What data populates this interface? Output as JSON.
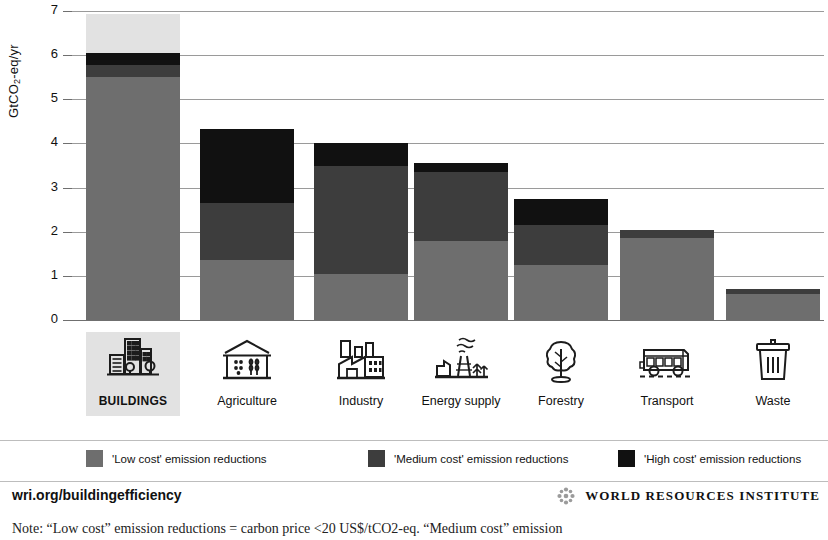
{
  "chart_data": {
    "type": "bar",
    "stacked": true,
    "title": "",
    "xlabel": "",
    "ylabel": "GtCO2-eq/yr",
    "ylim": [
      0,
      7
    ],
    "yticks": [
      0,
      1,
      2,
      3,
      4,
      5,
      6,
      7
    ],
    "ytick_labels": [
      "0",
      "1",
      "2",
      "3",
      "4",
      "5",
      "6",
      "7"
    ],
    "grid": true,
    "legend_position": "bottom",
    "categories": [
      "BUILDINGS",
      "Agriculture",
      "Industry",
      "Energy supply",
      "Forestry",
      "Transport",
      "Waste"
    ],
    "series": [
      {
        "name": "'Low cost' emission reductions",
        "color": "#6e6e6e",
        "values": [
          5.5,
          1.35,
          1.05,
          1.8,
          1.25,
          1.85,
          0.6
        ]
      },
      {
        "name": "'Medium cost' emission reductions",
        "color": "#3d3d3d",
        "values": [
          0.27,
          1.3,
          2.45,
          1.55,
          0.9,
          0.2,
          0.1
        ]
      },
      {
        "name": "'High cost' emission reductions",
        "color": "#111111",
        "values": [
          0.28,
          1.67,
          0.5,
          0.2,
          0.6,
          0.0,
          0.0
        ]
      }
    ],
    "totals": [
      6.05,
      4.32,
      4.0,
      3.55,
      2.75,
      2.05,
      0.7
    ],
    "highlighted_category": "BUILDINGS"
  },
  "axis": {
    "y_label_prefix": "GtCO",
    "y_label_sub": "2",
    "y_label_suffix": "-eq/yr"
  },
  "categories": [
    {
      "label": "BUILDINGS",
      "icon": "buildings-icon",
      "highlighted": true
    },
    {
      "label": "Agriculture",
      "icon": "agriculture-icon",
      "highlighted": false
    },
    {
      "label": "Industry",
      "icon": "industry-icon",
      "highlighted": false
    },
    {
      "label": "Energy supply",
      "icon": "energy-supply-icon",
      "highlighted": false
    },
    {
      "label": "Forestry",
      "icon": "forestry-icon",
      "highlighted": false
    },
    {
      "label": "Transport",
      "icon": "transport-icon",
      "highlighted": false
    },
    {
      "label": "Waste",
      "icon": "waste-icon",
      "highlighted": false
    }
  ],
  "legend": [
    {
      "label": "'Low cost' emission reductions",
      "color": "#6e6e6e"
    },
    {
      "label": "'Medium cost' emission reductions",
      "color": "#3d3d3d"
    },
    {
      "label": "'High cost' emission reductions",
      "color": "#111111"
    }
  ],
  "footer": {
    "url": "wri.org/buildingefficiency",
    "org_name": "WORLD RESOURCES INSTITUTE",
    "note": "Note: “Low cost” emission reductions = carbon price <20 US$/tCO2-eq. “Medium cost” emission"
  },
  "colors": {
    "low": "#6e6e6e",
    "medium": "#3d3d3d",
    "high": "#111111",
    "highlight_band": "#e2e2e2",
    "gridline": "#9a9a9a",
    "axis": "#6f6f6f"
  }
}
